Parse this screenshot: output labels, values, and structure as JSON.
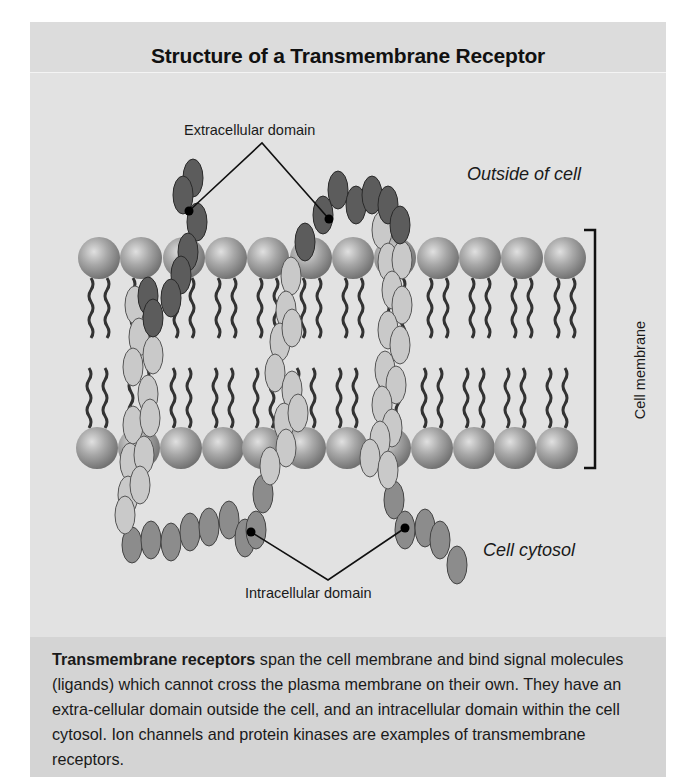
{
  "figure": {
    "title": "Structure of a Transmembrane Receptor",
    "labels": {
      "extracellular": "Extracellular domain",
      "intracellular": "Intracellular domain",
      "outside": "Outside of cell",
      "cytosol": "Cell cytosol",
      "membrane": "Cell membrane"
    },
    "caption": {
      "bold_lead": "Transmembrane receptors",
      "text": " span the cell membrane and bind signal molecules (ligands) which cannot cross the plasma membrane on their own. They have an extra-cellular domain outside the cell, and an intracellular domain within the cell cytosol. Ion channels and protein kinases are examples of transmembrane receptors."
    },
    "colors": {
      "background": "#e2e2e2",
      "caption_background": "#d4d4d4",
      "extracellular_segment": "#5a5a5a",
      "transmembrane_segment": "#c8c8c8",
      "intracellular_segment": "#8c8c8c",
      "phospholipid_head": "#9a9a9a"
    }
  }
}
